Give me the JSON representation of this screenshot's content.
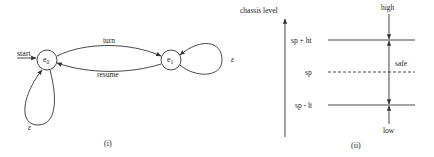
{
  "figure_i": {
    "caption": "(i)",
    "start_label": "start",
    "states": [
      {
        "id": "e0",
        "base": "e",
        "sub": "0"
      },
      {
        "id": "e1",
        "base": "e",
        "sub": "1"
      }
    ],
    "transitions": [
      {
        "from": "e0",
        "to": "e1",
        "label": "turn"
      },
      {
        "from": "e1",
        "to": "e0",
        "label": "resume"
      },
      {
        "from": "e0",
        "to": "e0",
        "label": "ε"
      },
      {
        "from": "e1",
        "to": "e1",
        "label": "ε"
      }
    ]
  },
  "figure_ii": {
    "caption": "(ii)",
    "axis_label": "chassis level",
    "levels": [
      {
        "label": "sp + ht",
        "style": "solid"
      },
      {
        "label": "sp",
        "style": "dashed"
      },
      {
        "label": "sp - lt",
        "style": "solid"
      }
    ],
    "regions": {
      "high": "high",
      "safe": "safe",
      "low": "low"
    }
  },
  "colors": {
    "stroke": "#333333",
    "text": "#222222",
    "background": "#ffffff"
  }
}
